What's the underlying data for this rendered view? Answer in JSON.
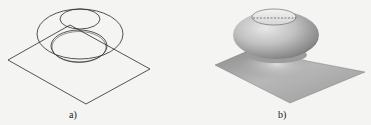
{
  "figures": [
    {
      "id": "a",
      "caption": "a)",
      "style": "wireframe",
      "description": "Wireframe of torus-like surface of revolution above a square plane",
      "stroke_color": "#2a2a2a"
    },
    {
      "id": "b",
      "caption": "b)",
      "style": "shaded",
      "description": "Shaded rendering of dome/torus blended into square plane",
      "surface_color": "#b4b4b4",
      "plane_color": "#9e9e9e"
    }
  ]
}
